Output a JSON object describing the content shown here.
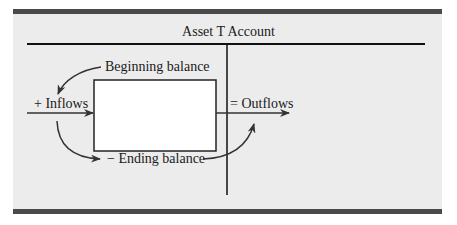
{
  "diagram": {
    "title": "Asset T Account",
    "labels": {
      "beginning_balance": "Beginning balance",
      "inflows": "+ Inflows",
      "outflows": "= Outflows",
      "ending_balance": "− Ending balance"
    },
    "colors": {
      "background": "#ececec",
      "rule": "#4a4a4a",
      "line": "#111111",
      "box_fill": "#ffffff",
      "text": "#1a1a1a"
    }
  }
}
